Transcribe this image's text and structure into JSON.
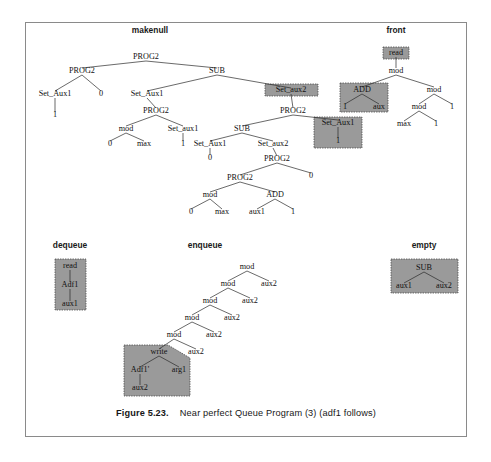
{
  "figure": {
    "caption_number": "Figure 5.23.",
    "caption_text": "Near perfect Queue Program (3) (adf1 follows)"
  },
  "colors": {
    "shade_fill": "#9a9a9a",
    "shade_stroke": "#4a4a4a",
    "edge": "#2a2a2a",
    "frame": "#8a8a8a",
    "text": "#111111"
  },
  "trees": [
    {
      "name": "makenull",
      "title": "makenull",
      "title_pos": {
        "x": 150,
        "y": 33
      },
      "nodes": [
        {
          "id": "mn-root",
          "label": "PROG2",
          "x": 146,
          "y": 59
        },
        {
          "id": "mn-l",
          "label": "PROG2",
          "x": 82,
          "y": 73
        },
        {
          "id": "mn-l-1",
          "label": "Set_Aux1",
          "x": 55,
          "y": 96
        },
        {
          "id": "mn-l-1-1",
          "label": "1",
          "x": 55,
          "y": 117
        },
        {
          "id": "mn-l-2",
          "label": "0",
          "x": 101,
          "y": 96
        },
        {
          "id": "mn-r",
          "label": "SUB",
          "x": 217,
          "y": 73
        },
        {
          "id": "mn-r-1",
          "label": "Set_Aux1",
          "x": 147,
          "y": 96
        },
        {
          "id": "mn-r-1-1",
          "label": "PROG2",
          "x": 156,
          "y": 113
        },
        {
          "id": "mn-mod1",
          "label": "mod",
          "x": 126,
          "y": 131
        },
        {
          "id": "mn-mod1-0",
          "label": "0",
          "x": 110,
          "y": 146
        },
        {
          "id": "mn-mod1-max",
          "label": "max",
          "x": 144,
          "y": 146
        },
        {
          "id": "mn-sa1b",
          "label": "Set_aux1",
          "x": 183,
          "y": 131
        },
        {
          "id": "mn-sa1b-1",
          "label": "1",
          "x": 183,
          "y": 146
        },
        {
          "id": "mn-sax2",
          "label": "Set_aux2",
          "x": 291,
          "y": 92
        },
        {
          "id": "mn-p2b",
          "label": "PROG2",
          "x": 293,
          "y": 113
        },
        {
          "id": "mn-sub2",
          "label": "SUB",
          "x": 242,
          "y": 131
        },
        {
          "id": "mn-sub2-l",
          "label": "Set_Aux1",
          "x": 210,
          "y": 146
        },
        {
          "id": "mn-sub2-l-0",
          "label": "0",
          "x": 210,
          "y": 160
        },
        {
          "id": "mn-sub2-r",
          "label": "Set_aux2",
          "x": 273,
          "y": 146
        },
        {
          "id": "mn-p2c",
          "label": "PROG2",
          "x": 277,
          "y": 161
        },
        {
          "id": "mn-p2d",
          "label": "PROG2",
          "x": 240,
          "y": 180
        },
        {
          "id": "mn-p2c-0",
          "label": "0",
          "x": 311,
          "y": 178
        },
        {
          "id": "mn-mod2",
          "label": "mod",
          "x": 210,
          "y": 197
        },
        {
          "id": "mn-mod2-0",
          "label": "0",
          "x": 191,
          "y": 214
        },
        {
          "id": "mn-mod2-max",
          "label": "max",
          "x": 222,
          "y": 214
        },
        {
          "id": "mn-add1",
          "label": "ADD",
          "x": 275,
          "y": 197
        },
        {
          "id": "mn-add1-aux1",
          "label": "aux1",
          "x": 257,
          "y": 214
        },
        {
          "id": "mn-add1-1",
          "label": "1",
          "x": 293,
          "y": 214
        },
        {
          "id": "mn-sa1c",
          "label": "Set_Aux1",
          "x": 338,
          "y": 125
        },
        {
          "id": "mn-sa1c-1",
          "label": "1",
          "x": 338,
          "y": 143
        }
      ],
      "shaded_boxes": [
        {
          "name": "set-aux2-box",
          "x": 265,
          "y": 84,
          "w": 53,
          "h": 12
        },
        {
          "name": "set-aux1-box",
          "x": 314,
          "y": 117,
          "w": 48,
          "h": 31
        }
      ]
    },
    {
      "name": "front",
      "title": "front",
      "title_pos": {
        "x": 396,
        "y": 33
      },
      "nodes": [
        {
          "id": "fr-read",
          "label": "read",
          "x": 396,
          "y": 55
        },
        {
          "id": "fr-mod",
          "label": "mod",
          "x": 396,
          "y": 73
        },
        {
          "id": "fr-add",
          "label": "ADD",
          "x": 362,
          "y": 92
        },
        {
          "id": "fr-add-1",
          "label": "1",
          "x": 345,
          "y": 109
        },
        {
          "id": "fr-add-aux",
          "label": "aux",
          "x": 379,
          "y": 109
        },
        {
          "id": "fr-mod2",
          "label": "mod",
          "x": 434,
          "y": 92
        },
        {
          "id": "fr-mod3",
          "label": "mod",
          "x": 419,
          "y": 109
        },
        {
          "id": "fr-mod3-max",
          "label": "max",
          "x": 404,
          "y": 126
        },
        {
          "id": "fr-mod3-1",
          "label": "1",
          "x": 436,
          "y": 126
        },
        {
          "id": "fr-mod2-1",
          "label": "1",
          "x": 452,
          "y": 109
        }
      ],
      "shaded_boxes": [
        {
          "name": "read-box",
          "x": 383,
          "y": 47,
          "w": 26,
          "h": 12
        },
        {
          "name": "add-box",
          "x": 340,
          "y": 83,
          "w": 48,
          "h": 29
        }
      ]
    },
    {
      "name": "dequeue",
      "title": "dequeue",
      "title_pos": {
        "x": 70,
        "y": 248
      },
      "nodes": [
        {
          "id": "dq-read",
          "label": "read",
          "x": 70,
          "y": 268
        },
        {
          "id": "dq-adf1",
          "label": "Adf1",
          "x": 70,
          "y": 287
        },
        {
          "id": "dq-aux1",
          "label": "aux1",
          "x": 70,
          "y": 306
        }
      ],
      "shaded_boxes": [
        {
          "name": "dequeue-box",
          "x": 55,
          "y": 259,
          "w": 31,
          "h": 51
        }
      ]
    },
    {
      "name": "enqueue",
      "title": "enqueue",
      "title_pos": {
        "x": 205,
        "y": 248
      },
      "nodes": [
        {
          "id": "eq-mod1",
          "label": "mod",
          "x": 247,
          "y": 269
        },
        {
          "id": "eq-mod1-aux2",
          "label": "aux2",
          "x": 269,
          "y": 286
        },
        {
          "id": "eq-mod2",
          "label": "mod",
          "x": 228,
          "y": 286
        },
        {
          "id": "eq-mod2-aux2",
          "label": "aux2",
          "x": 250,
          "y": 303
        },
        {
          "id": "eq-mod3",
          "label": "mod",
          "x": 210,
          "y": 303
        },
        {
          "id": "eq-mod3-aux2",
          "label": "aux2",
          "x": 232,
          "y": 320
        },
        {
          "id": "eq-mod4",
          "label": "mod",
          "x": 192,
          "y": 320
        },
        {
          "id": "eq-mod4-aux2",
          "label": "aux2",
          "x": 214,
          "y": 337
        },
        {
          "id": "eq-mod5",
          "label": "mod",
          "x": 174,
          "y": 337
        },
        {
          "id": "eq-mod5-aux2",
          "label": "aux2",
          "x": 196,
          "y": 354
        },
        {
          "id": "eq-write",
          "label": "write",
          "x": 159,
          "y": 354
        },
        {
          "id": "eq-adf1",
          "label": "Adf1'",
          "x": 140,
          "y": 372
        },
        {
          "id": "eq-arg1",
          "label": "arg1",
          "x": 179,
          "y": 372
        },
        {
          "id": "eq-aux2",
          "label": "aux2",
          "x": 140,
          "y": 390
        }
      ],
      "shaded_boxes": [
        {
          "name": "enqueue-write-box",
          "points": "124,345 168,345 190,358 190,396 124,396"
        }
      ]
    },
    {
      "name": "empty",
      "title": "empty",
      "title_pos": {
        "x": 424,
        "y": 248
      },
      "nodes": [
        {
          "id": "em-sub",
          "label": "SUB",
          "x": 424,
          "y": 270
        },
        {
          "id": "em-aux1",
          "label": "aux1",
          "x": 404,
          "y": 288
        },
        {
          "id": "em-aux2",
          "label": "aux2",
          "x": 444,
          "y": 288
        }
      ],
      "shaded_boxes": [
        {
          "name": "empty-box",
          "x": 391,
          "y": 259,
          "w": 67,
          "h": 34
        }
      ]
    }
  ],
  "edges": [
    {
      "x1": 146,
      "y1": 61,
      "x2": 82,
      "y2": 68
    },
    {
      "x1": 146,
      "y1": 61,
      "x2": 217,
      "y2": 68
    },
    {
      "x1": 82,
      "y1": 75,
      "x2": 55,
      "y2": 91
    },
    {
      "x1": 82,
      "y1": 75,
      "x2": 101,
      "y2": 91
    },
    {
      "x1": 55,
      "y1": 98,
      "x2": 55,
      "y2": 112
    },
    {
      "x1": 217,
      "y1": 75,
      "x2": 147,
      "y2": 91
    },
    {
      "x1": 217,
      "y1": 75,
      "x2": 291,
      "y2": 88
    },
    {
      "x1": 147,
      "y1": 98,
      "x2": 156,
      "y2": 108
    },
    {
      "x1": 156,
      "y1": 115,
      "x2": 126,
      "y2": 126
    },
    {
      "x1": 156,
      "y1": 115,
      "x2": 183,
      "y2": 126
    },
    {
      "x1": 126,
      "y1": 133,
      "x2": 110,
      "y2": 141
    },
    {
      "x1": 126,
      "y1": 133,
      "x2": 144,
      "y2": 141
    },
    {
      "x1": 183,
      "y1": 133,
      "x2": 183,
      "y2": 141
    },
    {
      "x1": 291,
      "y1": 94,
      "x2": 293,
      "y2": 108
    },
    {
      "x1": 293,
      "y1": 115,
      "x2": 242,
      "y2": 126
    },
    {
      "x1": 293,
      "y1": 115,
      "x2": 338,
      "y2": 120
    },
    {
      "x1": 242,
      "y1": 133,
      "x2": 210,
      "y2": 141
    },
    {
      "x1": 242,
      "y1": 133,
      "x2": 273,
      "y2": 141
    },
    {
      "x1": 210,
      "y1": 148,
      "x2": 210,
      "y2": 155
    },
    {
      "x1": 273,
      "y1": 148,
      "x2": 277,
      "y2": 156
    },
    {
      "x1": 277,
      "y1": 163,
      "x2": 240,
      "y2": 175
    },
    {
      "x1": 277,
      "y1": 163,
      "x2": 311,
      "y2": 173
    },
    {
      "x1": 240,
      "y1": 182,
      "x2": 210,
      "y2": 192
    },
    {
      "x1": 240,
      "y1": 182,
      "x2": 275,
      "y2": 192
    },
    {
      "x1": 210,
      "y1": 199,
      "x2": 191,
      "y2": 209
    },
    {
      "x1": 210,
      "y1": 199,
      "x2": 222,
      "y2": 209
    },
    {
      "x1": 275,
      "y1": 199,
      "x2": 257,
      "y2": 209
    },
    {
      "x1": 275,
      "y1": 199,
      "x2": 293,
      "y2": 209
    },
    {
      "x1": 338,
      "y1": 127,
      "x2": 338,
      "y2": 138
    },
    {
      "x1": 396,
      "y1": 57,
      "x2": 396,
      "y2": 68
    },
    {
      "x1": 396,
      "y1": 75,
      "x2": 362,
      "y2": 87
    },
    {
      "x1": 396,
      "y1": 75,
      "x2": 434,
      "y2": 87
    },
    {
      "x1": 362,
      "y1": 94,
      "x2": 345,
      "y2": 104
    },
    {
      "x1": 362,
      "y1": 94,
      "x2": 379,
      "y2": 104
    },
    {
      "x1": 434,
      "y1": 94,
      "x2": 419,
      "y2": 104
    },
    {
      "x1": 434,
      "y1": 94,
      "x2": 452,
      "y2": 104
    },
    {
      "x1": 419,
      "y1": 111,
      "x2": 404,
      "y2": 121
    },
    {
      "x1": 419,
      "y1": 111,
      "x2": 436,
      "y2": 121
    },
    {
      "x1": 70,
      "y1": 270,
      "x2": 70,
      "y2": 282
    },
    {
      "x1": 70,
      "y1": 289,
      "x2": 70,
      "y2": 301
    },
    {
      "x1": 247,
      "y1": 271,
      "x2": 228,
      "y2": 281
    },
    {
      "x1": 247,
      "y1": 271,
      "x2": 269,
      "y2": 281
    },
    {
      "x1": 228,
      "y1": 288,
      "x2": 210,
      "y2": 298
    },
    {
      "x1": 228,
      "y1": 288,
      "x2": 250,
      "y2": 298
    },
    {
      "x1": 210,
      "y1": 305,
      "x2": 192,
      "y2": 315
    },
    {
      "x1": 210,
      "y1": 305,
      "x2": 232,
      "y2": 315
    },
    {
      "x1": 192,
      "y1": 322,
      "x2": 174,
      "y2": 332
    },
    {
      "x1": 192,
      "y1": 322,
      "x2": 214,
      "y2": 332
    },
    {
      "x1": 174,
      "y1": 339,
      "x2": 159,
      "y2": 349
    },
    {
      "x1": 174,
      "y1": 339,
      "x2": 196,
      "y2": 349
    },
    {
      "x1": 159,
      "y1": 356,
      "x2": 140,
      "y2": 367
    },
    {
      "x1": 159,
      "y1": 356,
      "x2": 179,
      "y2": 367
    },
    {
      "x1": 140,
      "y1": 374,
      "x2": 140,
      "y2": 385
    },
    {
      "x1": 424,
      "y1": 272,
      "x2": 404,
      "y2": 283
    },
    {
      "x1": 424,
      "y1": 272,
      "x2": 444,
      "y2": 283
    }
  ]
}
